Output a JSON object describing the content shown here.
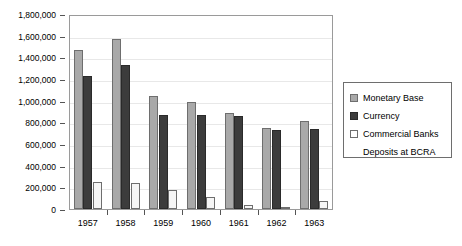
{
  "chart_data": {
    "type": "bar",
    "title": "",
    "xlabel": "",
    "ylabel": "",
    "ylim": [
      0,
      1800000
    ],
    "ytick_step": 200000,
    "grid": true,
    "legend_position": "right",
    "categories": [
      "1957",
      "1958",
      "1959",
      "1960",
      "1961",
      "1962",
      "1963"
    ],
    "ytick_labels": [
      "1,800,000",
      "1,600,000",
      "1,400,000",
      "1,200,000",
      "1,000,000",
      "800,000",
      "600,000",
      "400,000",
      "200,000",
      "0"
    ],
    "series": [
      {
        "name": "Monetary Base",
        "color": "#a9a9a9",
        "values": [
          1470000,
          1565000,
          1045000,
          985000,
          890000,
          750000,
          815000
        ]
      },
      {
        "name": "Currency",
        "color": "#3c3c3c",
        "values": [
          1230000,
          1325000,
          865000,
          865000,
          855000,
          730000,
          735000
        ]
      },
      {
        "name": "Commercial Banks Deposits at BCRA",
        "color": "#f6f6f6",
        "values": [
          245000,
          240000,
          180000,
          115000,
          35000,
          20000,
          75000
        ]
      }
    ]
  },
  "legend": {
    "entries": [
      {
        "label": "Monetary Base",
        "label_line2": ""
      },
      {
        "label": "Currency",
        "label_line2": ""
      },
      {
        "label": "Commercial Banks",
        "label_line2": "Deposits at BCRA"
      }
    ]
  }
}
